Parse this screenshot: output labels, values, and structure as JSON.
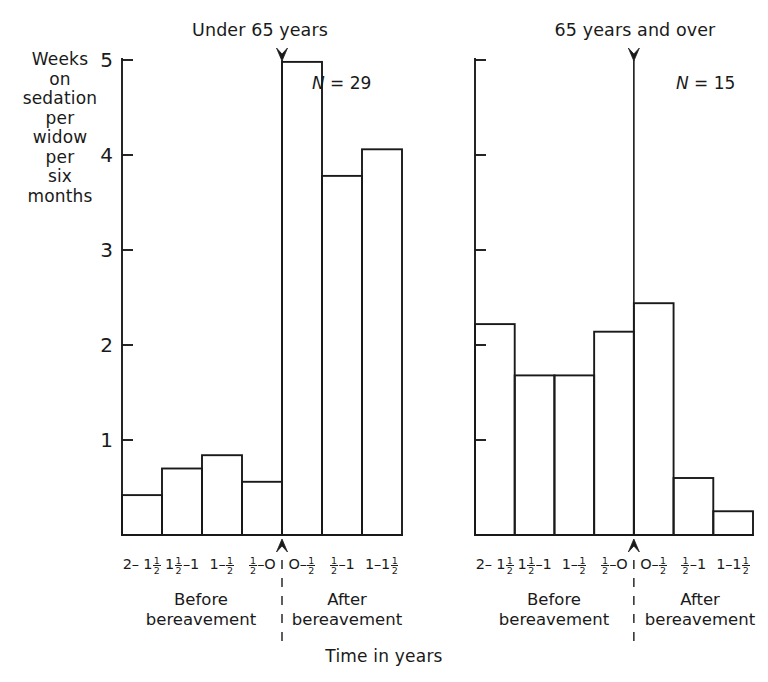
{
  "figure": {
    "axis_title": "Time in years",
    "y_axis_label": "Weeks\non\nsedation\nper\nwidow\nper\nsix\nmonths",
    "crop_remnant": ""
  },
  "panels": [
    {
      "title": "Under 65 years",
      "n_prefix": "N",
      "n_equals": " = ",
      "n_value": "29",
      "before_caption": "Before\nbereavement",
      "after_caption": "After\nbereavement"
    },
    {
      "title": "65 years and over",
      "n_prefix": "N",
      "n_equals": " = ",
      "n_value": "15",
      "before_caption": "Before\nbereavement",
      "after_caption": "After\nbereavement"
    }
  ],
  "x_tick_labels": [
    {
      "pre": "2– 1",
      "frac_num": "1",
      "frac_den": "2",
      "post": ""
    },
    {
      "pre": "1",
      "frac_num": "1",
      "frac_den": "2",
      "post": "–1"
    },
    {
      "pre": "1– ",
      "frac_num": "1",
      "frac_den": "2",
      "post": ""
    },
    {
      "pre": "",
      "frac_num": "1",
      "frac_den": "2",
      "post": "–O"
    },
    {
      "pre": "O– ",
      "frac_num": "1",
      "frac_den": "2",
      "post": ""
    },
    {
      "pre": "",
      "frac_num": "1",
      "frac_den": "2",
      "post": "–1"
    },
    {
      "pre": "1–1",
      "frac_num": "1",
      "frac_den": "2",
      "post": ""
    }
  ],
  "y_tick_labels": [
    "1",
    "2",
    "3",
    "4",
    "5"
  ],
  "chart_data": {
    "type": "bar",
    "xlabel": "Time in years",
    "ylabel": "Weeks on sedation per widow per six months",
    "ylim": [
      0,
      5.1
    ],
    "yticks": [
      1,
      2,
      3,
      4,
      5
    ],
    "grid": false,
    "legend": "none",
    "categories": [
      "2–1½",
      "1½–1",
      "1–½",
      "½–O",
      "O–½",
      "½–1",
      "1–1½"
    ],
    "category_groups": [
      "Before bereavement",
      "Before bereavement",
      "Before bereavement",
      "Before bereavement",
      "After bereavement",
      "After bereavement",
      "After bereavement"
    ],
    "bereavement_index": 4,
    "series": [
      {
        "name": "Under 65 years",
        "n": 29,
        "values": [
          0.42,
          0.7,
          0.84,
          0.56,
          4.98,
          3.78,
          4.06
        ]
      },
      {
        "name": "65 years and over",
        "n": 15,
        "values": [
          2.22,
          1.68,
          1.68,
          2.14,
          2.44,
          0.6,
          0.25
        ]
      }
    ]
  },
  "geometry": {
    "baseline_y": 535,
    "unit_px": 95,
    "panels": [
      {
        "x0": 122,
        "x1": 402,
        "axis_x": 122
      },
      {
        "x0": 475,
        "x1": 753,
        "axis_x": 475
      }
    ]
  }
}
